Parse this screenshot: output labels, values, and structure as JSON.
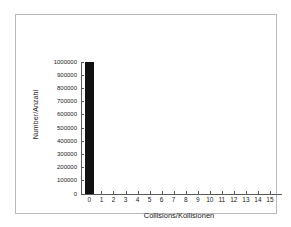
{
  "chart_data": {
    "type": "bar",
    "title": "",
    "subtitle": "",
    "xlabel": "Collisions/Kollisionen",
    "ylabel": "Number/Anzahl",
    "categories": [
      "0",
      "1",
      "2",
      "3",
      "4",
      "5",
      "6",
      "7",
      "8",
      "9",
      "10",
      "11",
      "12",
      "13",
      "14",
      "15"
    ],
    "values": [
      1000000,
      0,
      0,
      0,
      0,
      0,
      0,
      0,
      0,
      0,
      0,
      0,
      0,
      0,
      0,
      0
    ],
    "xlim": [
      -0.7,
      16.0
    ],
    "ylim": [
      0,
      1000000
    ],
    "yticks": [
      0,
      100000,
      200000,
      300000,
      400000,
      500000,
      600000,
      700000,
      800000,
      900000,
      1000000
    ],
    "ytick_labels": [
      "0",
      "100000",
      "200000",
      "300000",
      "400000",
      "500000",
      "600000",
      "700000",
      "800000",
      "900000",
      "1000000"
    ],
    "xtick_labels": [
      "0",
      "1",
      "2",
      "3",
      "4",
      "5",
      "6",
      "7",
      "8",
      "9",
      "10",
      "11",
      "12",
      "13",
      "14",
      "15"
    ],
    "grid": false,
    "legend": null,
    "bar_color": "#111111",
    "axis_color": "#5a5a5a",
    "frame_color": "#b9b9b9",
    "background_color": "#ffffff"
  }
}
